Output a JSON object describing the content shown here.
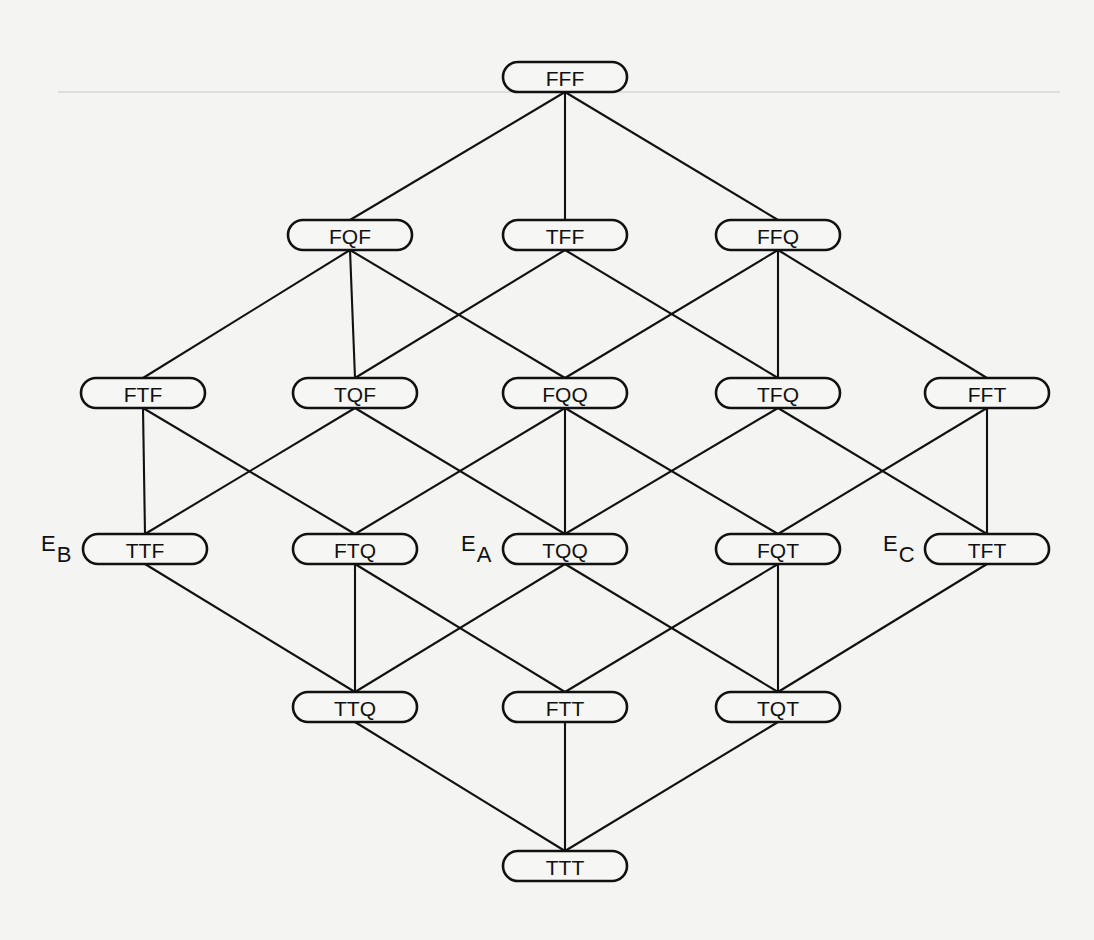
{
  "diagram": {
    "type": "lattice",
    "node_size": {
      "width": 124,
      "height": 30,
      "radius": 15
    },
    "nodes": [
      {
        "id": "FFF",
        "label": "FFF",
        "x": 565,
        "y": 77
      },
      {
        "id": "FQF",
        "label": "FQF",
        "x": 350,
        "y": 235
      },
      {
        "id": "TFF",
        "label": "TFF",
        "x": 565,
        "y": 235
      },
      {
        "id": "FFQ",
        "label": "FFQ",
        "x": 778,
        "y": 235
      },
      {
        "id": "FTF",
        "label": "FTF",
        "x": 143,
        "y": 393
      },
      {
        "id": "TQF",
        "label": "TQF",
        "x": 355,
        "y": 393
      },
      {
        "id": "FQQ",
        "label": "FQQ",
        "x": 565,
        "y": 393
      },
      {
        "id": "TFQ",
        "label": "TFQ",
        "x": 778,
        "y": 393
      },
      {
        "id": "FFT",
        "label": "FFT",
        "x": 987,
        "y": 393
      },
      {
        "id": "TTF",
        "label": "TTF",
        "x": 145,
        "y": 549,
        "annotation": {
          "main": "E",
          "sub": "B"
        }
      },
      {
        "id": "FTQ",
        "label": "FTQ",
        "x": 355,
        "y": 549
      },
      {
        "id": "TQQ",
        "label": "TQQ",
        "x": 565,
        "y": 549,
        "annotation": {
          "main": "E",
          "sub": "A"
        }
      },
      {
        "id": "FQT",
        "label": "FQT",
        "x": 778,
        "y": 549
      },
      {
        "id": "TFT",
        "label": "TFT",
        "x": 987,
        "y": 549,
        "annotation": {
          "main": "E",
          "sub": "C"
        }
      },
      {
        "id": "TTQ",
        "label": "TTQ",
        "x": 355,
        "y": 707
      },
      {
        "id": "FTT",
        "label": "FTT",
        "x": 565,
        "y": 707
      },
      {
        "id": "TQT",
        "label": "TQT",
        "x": 778,
        "y": 707
      },
      {
        "id": "TTT",
        "label": "TTT",
        "x": 565,
        "y": 866
      }
    ],
    "edges": [
      [
        "FFF",
        "FQF"
      ],
      [
        "FFF",
        "TFF"
      ],
      [
        "FFF",
        "FFQ"
      ],
      [
        "FQF",
        "FTF"
      ],
      [
        "FQF",
        "TQF"
      ],
      [
        "FQF",
        "FQQ"
      ],
      [
        "TFF",
        "TQF"
      ],
      [
        "TFF",
        "TFQ"
      ],
      [
        "FFQ",
        "FQQ"
      ],
      [
        "FFQ",
        "TFQ"
      ],
      [
        "FFQ",
        "FFT"
      ],
      [
        "FTF",
        "TTF"
      ],
      [
        "FTF",
        "FTQ"
      ],
      [
        "TQF",
        "TTF"
      ],
      [
        "TQF",
        "TQQ"
      ],
      [
        "FQQ",
        "FTQ"
      ],
      [
        "FQQ",
        "TQQ"
      ],
      [
        "FQQ",
        "FQT"
      ],
      [
        "TFQ",
        "TQQ"
      ],
      [
        "TFQ",
        "TFT"
      ],
      [
        "FFT",
        "FQT"
      ],
      [
        "FFT",
        "TFT"
      ],
      [
        "TTF",
        "TTQ"
      ],
      [
        "FTQ",
        "TTQ"
      ],
      [
        "FTQ",
        "FTT"
      ],
      [
        "TQQ",
        "TTQ"
      ],
      [
        "TQQ",
        "TQT"
      ],
      [
        "FQT",
        "FTT"
      ],
      [
        "FQT",
        "TQT"
      ],
      [
        "TFT",
        "TQT"
      ],
      [
        "TTQ",
        "TTT"
      ],
      [
        "FTT",
        "TTT"
      ],
      [
        "TQT",
        "TTT"
      ]
    ],
    "annotations": [
      {
        "node": "TTF",
        "main": "E",
        "sub": "B"
      },
      {
        "node": "TQQ",
        "main": "E",
        "sub": "A"
      },
      {
        "node": "TFT",
        "main": "E",
        "sub": "C"
      }
    ],
    "colors": {
      "ink": "#111111",
      "paper": "#f4f4f2"
    }
  }
}
